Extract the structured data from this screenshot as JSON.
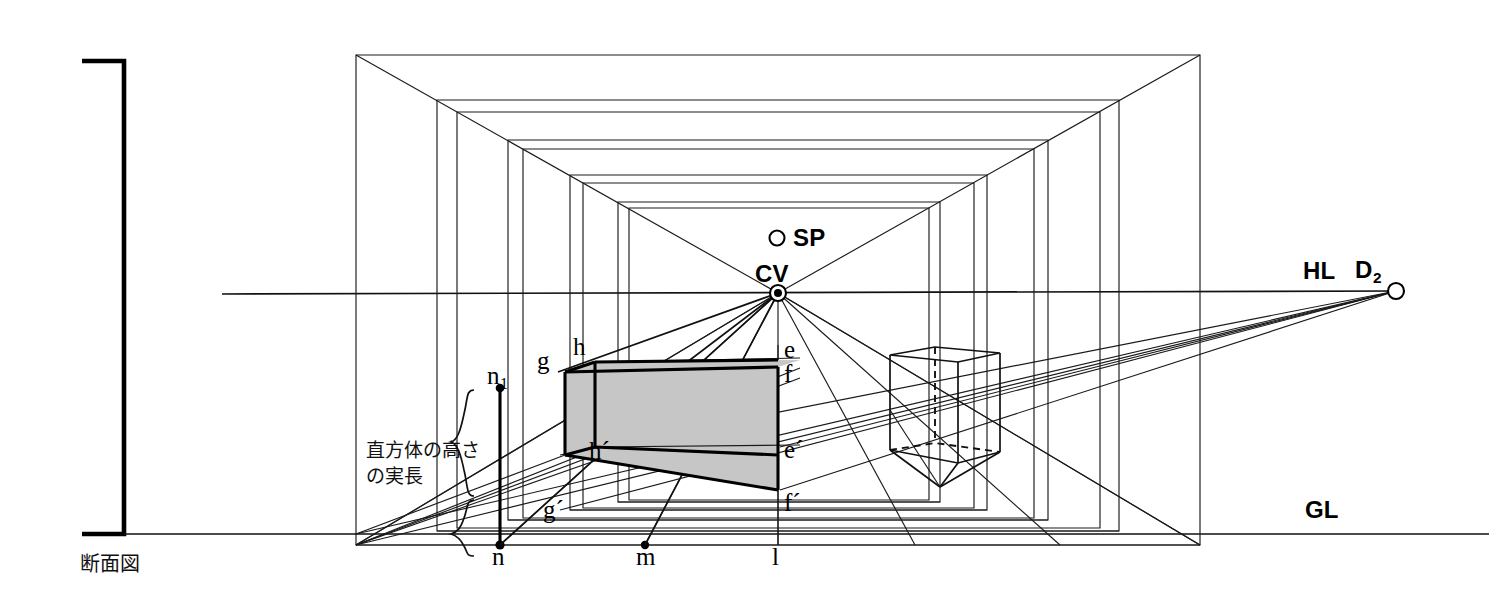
{
  "figure": {
    "caption": "断面図",
    "annotation_line1": "直方体の高さ",
    "annotation_line2": "の実長",
    "type": "one-point-perspective-construction"
  },
  "reference_lines": {
    "horizon_label": "HL",
    "ground_label": "GL"
  },
  "points": {
    "station_point": "SP",
    "center_of_vision": "CV",
    "diagonal_vp": "D",
    "diagonal_vp_sub": "2"
  },
  "cuboid_vertices": {
    "top_back_left": "g",
    "top_front_left": "h",
    "top_back_right": "e",
    "top_front_right": "f",
    "bottom_back_left": "g´",
    "bottom_front_left": "h´",
    "bottom_back_right": "e´",
    "bottom_front_right": "f´"
  },
  "ground_line_points": {
    "p1": "n",
    "p1_sub": "1",
    "p2": "n",
    "p3": "m",
    "p4": "l"
  },
  "colors": {
    "stroke": "#111111",
    "face_fill": "#c6c6c6",
    "background": "#ffffff"
  }
}
